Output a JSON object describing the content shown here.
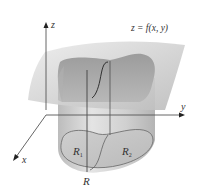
{
  "figure": {
    "surface_label": "z = f(x, y)",
    "axes": {
      "z": "z",
      "y": "y",
      "x": "x"
    },
    "regions": {
      "r1": {
        "main": "R",
        "sub": "1"
      },
      "r2": {
        "main": "R",
        "sub": "2"
      },
      "r": "R"
    }
  },
  "colors": {
    "surface": "#c9c9c9",
    "surface_light": "#e6e6e6",
    "solid_top": "#a8a8a8",
    "cylinder": "#d2d2d2",
    "base": "#c4c4c4",
    "lines": "#333333"
  }
}
